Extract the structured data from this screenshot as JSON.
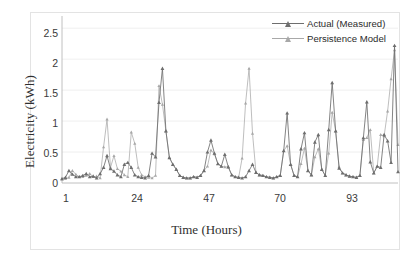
{
  "figure": {
    "background": "#ffffff",
    "border_color": "#e3e3e3"
  },
  "axes": {
    "ylabel": "Electricity (kWh)",
    "xlabel": "Time (Hours)",
    "yticks": [
      "0",
      "0.5",
      "1",
      "1.5",
      "2",
      "2.5"
    ],
    "xticks": [
      "1",
      "24",
      "47",
      "70",
      "93"
    ]
  },
  "legend": {
    "items": [
      {
        "label": "Actual (Measured)",
        "color": "#6e6e6e",
        "marker": "triangle"
      },
      {
        "label": "Persistence Model",
        "color": "#a8a8a8",
        "marker": "triangle"
      }
    ]
  },
  "chart_data": {
    "type": "line",
    "title": "",
    "xlabel": "Time (Hours)",
    "ylabel": "Electricity (kWh)",
    "xlim": [
      1,
      98
    ],
    "ylim": [
      0,
      2.6
    ],
    "yticks": [
      0,
      0.5,
      1,
      1.5,
      2,
      2.5
    ],
    "xticks": [
      1,
      24,
      47,
      70,
      93
    ],
    "grid": "horizontal",
    "legend_position": "top-right",
    "x": [
      1,
      2,
      3,
      4,
      5,
      6,
      7,
      8,
      9,
      10,
      11,
      12,
      13,
      14,
      15,
      16,
      17,
      18,
      19,
      20,
      21,
      22,
      23,
      24,
      25,
      26,
      27,
      28,
      29,
      30,
      31,
      32,
      33,
      34,
      35,
      36,
      37,
      38,
      39,
      40,
      41,
      42,
      43,
      44,
      45,
      46,
      47,
      48,
      49,
      50,
      51,
      52,
      53,
      54,
      55,
      56,
      57,
      58,
      59,
      60,
      61,
      62,
      63,
      64,
      65,
      66,
      67,
      68,
      69,
      70,
      71,
      72,
      73,
      74,
      75,
      76,
      77,
      78,
      79,
      80,
      81,
      82,
      83,
      84,
      85,
      86,
      87,
      88,
      89,
      90,
      91,
      92,
      93,
      94,
      95,
      96,
      97,
      98
    ],
    "series": [
      {
        "name": "Actual (Measured)",
        "color": "#6e6e6e",
        "marker": "triangle",
        "values": [
          0.07,
          0.09,
          0.2,
          0.14,
          0.1,
          0.1,
          0.12,
          0.15,
          0.1,
          0.11,
          0.08,
          0.15,
          0.25,
          0.44,
          0.23,
          0.19,
          0.13,
          0.1,
          0.3,
          0.33,
          0.25,
          0.13,
          0.1,
          0.09,
          0.08,
          0.12,
          0.48,
          0.42,
          1.3,
          1.85,
          0.84,
          0.41,
          0.3,
          0.22,
          0.12,
          0.09,
          0.08,
          0.08,
          0.1,
          0.09,
          0.12,
          0.2,
          0.5,
          0.69,
          0.48,
          0.31,
          0.27,
          0.46,
          0.26,
          0.13,
          0.1,
          0.09,
          0.08,
          0.1,
          0.2,
          0.3,
          0.17,
          0.13,
          0.12,
          0.1,
          0.09,
          0.08,
          0.1,
          0.12,
          0.52,
          1.13,
          0.3,
          0.12,
          0.1,
          0.55,
          0.81,
          0.2,
          0.13,
          0.66,
          0.78,
          0.22,
          0.12,
          0.86,
          1.62,
          0.84,
          0.24,
          0.16,
          0.13,
          0.11,
          0.1,
          0.09,
          0.12,
          0.73,
          1.31,
          0.34,
          0.16,
          0.27,
          0.25,
          0.78,
          0.68,
          0.33,
          2.22,
          0.18
        ]
      },
      {
        "name": "Persistence Model",
        "color": "#a8a8a8",
        "marker": "triangle",
        "values": [
          0.06,
          0.07,
          0.09,
          0.2,
          0.14,
          0.1,
          0.1,
          0.12,
          0.15,
          0.1,
          0.11,
          0.08,
          0.58,
          1.03,
          0.25,
          0.44,
          0.23,
          0.19,
          0.13,
          0.1,
          0.82,
          0.64,
          0.25,
          0.13,
          0.1,
          0.09,
          0.08,
          0.12,
          1.57,
          1.27,
          0.84,
          0.41,
          0.3,
          0.22,
          0.12,
          0.09,
          0.08,
          0.08,
          0.1,
          0.09,
          0.12,
          0.2,
          0.27,
          0.53,
          0.47,
          0.31,
          0.27,
          0.26,
          0.26,
          0.13,
          0.1,
          0.09,
          0.4,
          1.29,
          1.85,
          0.8,
          0.17,
          0.13,
          0.12,
          0.1,
          0.09,
          0.08,
          0.1,
          0.12,
          0.52,
          0.6,
          0.3,
          0.12,
          0.1,
          0.31,
          0.56,
          0.2,
          0.13,
          0.42,
          0.55,
          0.22,
          0.12,
          0.48,
          1.14,
          0.84,
          0.26,
          0.16,
          0.13,
          0.11,
          0.1,
          0.09,
          0.12,
          0.7,
          0.73,
          0.86,
          0.16,
          0.27,
          0.78,
          0.76,
          1.16,
          1.68,
          2.15,
          0.62
        ]
      }
    ]
  }
}
